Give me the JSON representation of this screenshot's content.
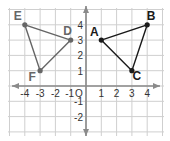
{
  "diagram": {
    "type": "coordinate-plane",
    "x_range": [
      -4,
      4
    ],
    "y_range": [
      -2,
      4
    ],
    "origin_label": "O",
    "x_tick_labels": [
      "-4",
      "-3",
      "-2",
      "-1",
      "1",
      "2",
      "3",
      "4"
    ],
    "y_tick_labels": [
      "4",
      "3",
      "2",
      "1",
      "-1",
      "-2"
    ],
    "triangles": [
      {
        "name": "ABC",
        "color": "#1a1a1a",
        "vertices": [
          {
            "label": "A",
            "x": 1,
            "y": 3
          },
          {
            "label": "B",
            "x": 4,
            "y": 4
          },
          {
            "label": "C",
            "x": 3,
            "y": 1
          }
        ]
      },
      {
        "name": "DEF",
        "color": "#666666",
        "vertices": [
          {
            "label": "D",
            "x": -1,
            "y": 3
          },
          {
            "label": "E",
            "x": -4,
            "y": 4
          },
          {
            "label": "F",
            "x": -3,
            "y": 1
          }
        ]
      }
    ],
    "colors": {
      "grid": "#cfcfcf",
      "axis": "#8a8a8a",
      "abc": "#1a1a1a",
      "def": "#666666"
    }
  }
}
